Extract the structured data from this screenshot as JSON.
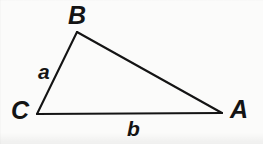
{
  "figure": {
    "type": "geometry-diagram",
    "shape": "triangle",
    "background_color": "#fbfbfa",
    "stroke_color": "#141414",
    "stroke_width": 2,
    "vertices": [
      {
        "name": "B",
        "label": "B",
        "x": 77,
        "y": 32
      },
      {
        "name": "C",
        "label": "C",
        "x": 37,
        "y": 114
      },
      {
        "name": "A",
        "label": "A",
        "x": 222,
        "y": 113
      }
    ],
    "sides": [
      {
        "name": "a",
        "label": "a",
        "from": "C",
        "to": "B",
        "label_x": 44,
        "label_y": 72
      },
      {
        "name": "b",
        "label": "b",
        "from": "C",
        "to": "A",
        "label_x": 133,
        "label_y": 130
      },
      {
        "name": "c",
        "label": "",
        "from": "B",
        "to": "A",
        "label_x": 0,
        "label_y": 0
      }
    ],
    "edge_path": "M 77 32 L 222 113 L 37 114 Z"
  }
}
